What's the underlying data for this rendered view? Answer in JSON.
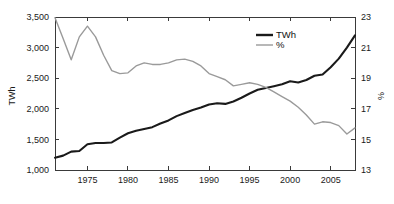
{
  "chart_data": {
    "type": "line",
    "title": "",
    "subtitle": "",
    "xlabel": "",
    "ylabel": "TWh",
    "y2label": "%",
    "xlim": [
      1971,
      2008
    ],
    "ylim": [
      1000,
      3500
    ],
    "y2lim": [
      13,
      23
    ],
    "grid": false,
    "legend_position": "top-center",
    "x": [
      1971,
      1972,
      1973,
      1974,
      1975,
      1976,
      1977,
      1978,
      1979,
      1980,
      1981,
      1982,
      1983,
      1984,
      1985,
      1986,
      1987,
      1988,
      1989,
      1990,
      1991,
      1992,
      1993,
      1994,
      1995,
      1996,
      1997,
      1998,
      1999,
      2000,
      2001,
      2002,
      2003,
      2004,
      2005,
      2006,
      2007,
      2008
    ],
    "xticks": [
      1975,
      1980,
      1985,
      1990,
      1995,
      2000,
      2005
    ],
    "xticklabels": [
      "1975",
      "1980",
      "1985",
      "1990",
      "1995",
      "2000",
      "2005"
    ],
    "yticks": [
      1000,
      1500,
      2000,
      2500,
      3000,
      3500
    ],
    "yticklabels": [
      "1,000",
      "1,500",
      "2,000",
      "2,500",
      "3,000",
      "3,500"
    ],
    "y2ticks": [
      13,
      15,
      17,
      19,
      21,
      23
    ],
    "y2ticklabels": [
      "13",
      "15",
      "17",
      "19",
      "21",
      "23"
    ],
    "series": [
      {
        "name": "TWh",
        "axis": "left",
        "color": "#1a1a1a",
        "width": 2.1,
        "values": [
          1200,
          1235,
          1300,
          1310,
          1420,
          1440,
          1440,
          1450,
          1530,
          1600,
          1640,
          1670,
          1700,
          1760,
          1810,
          1880,
          1930,
          1980,
          2020,
          2070,
          2090,
          2080,
          2120,
          2180,
          2250,
          2310,
          2340,
          2370,
          2400,
          2450,
          2430,
          2470,
          2540,
          2560,
          2680,
          2820,
          3000,
          3200
        ]
      },
      {
        "name": "%",
        "axis": "right",
        "color": "#9a9a9a",
        "width": 1.4,
        "values": [
          22.95,
          21.6,
          20.2,
          21.7,
          22.4,
          21.7,
          20.5,
          19.5,
          19.3,
          19.35,
          19.8,
          20.0,
          19.9,
          19.9,
          20.0,
          20.2,
          20.25,
          20.1,
          19.8,
          19.3,
          19.1,
          18.9,
          18.5,
          18.6,
          18.7,
          18.6,
          18.4,
          18.1,
          17.8,
          17.5,
          17.1,
          16.6,
          16.0,
          16.15,
          16.1,
          15.9,
          15.35,
          15.75
        ]
      }
    ],
    "legend": [
      {
        "label": "TWh",
        "color": "#1a1a1a",
        "width": 2.4
      },
      {
        "label": "%",
        "color": "#9a9a9a",
        "width": 1.4
      }
    ]
  }
}
